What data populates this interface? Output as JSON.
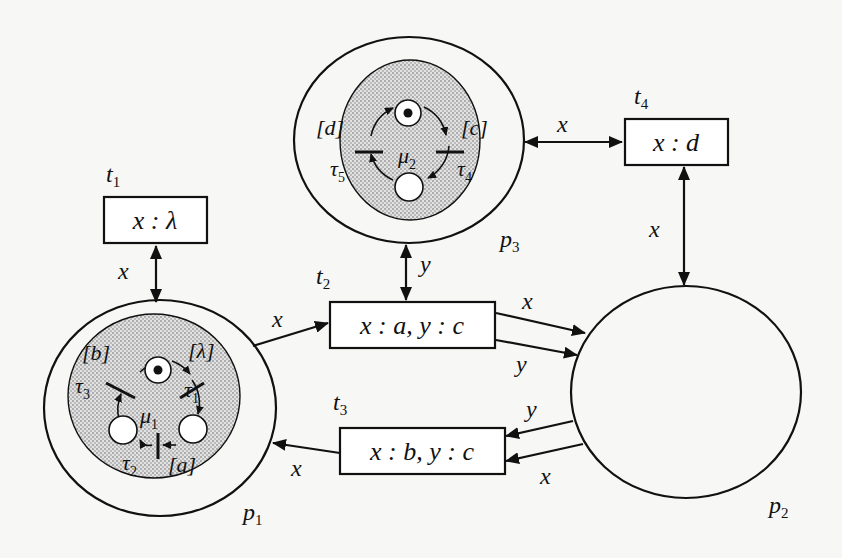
{
  "diagram": {
    "type": "nested-petri-net",
    "places": [
      {
        "id": "p1",
        "label": "p",
        "sub": "1",
        "inner_net": "mu1"
      },
      {
        "id": "p2",
        "label": "p",
        "sub": "2"
      },
      {
        "id": "p3",
        "label": "p",
        "sub": "3",
        "inner_net": "mu2"
      }
    ],
    "transitions": [
      {
        "id": "t1",
        "label": "t",
        "sub": "1",
        "guard": "x : λ"
      },
      {
        "id": "t2",
        "label": "t",
        "sub": "2",
        "guard": "x : a, y : c"
      },
      {
        "id": "t3",
        "label": "t",
        "sub": "3",
        "guard": "x : b, y : c"
      },
      {
        "id": "t4",
        "label": "t",
        "sub": "4",
        "guard": "x : d"
      }
    ],
    "arcs": [
      {
        "from": "p1",
        "to": "t1",
        "label": "x",
        "bidirectional": true
      },
      {
        "from": "p1",
        "to": "t2",
        "label": "x"
      },
      {
        "from": "p3",
        "to": "t2",
        "label": "y",
        "bidirectional": true
      },
      {
        "from": "t2",
        "to": "p2",
        "label": "x"
      },
      {
        "from": "t2",
        "to": "p2",
        "label": "y"
      },
      {
        "from": "p2",
        "to": "t3",
        "label": "y"
      },
      {
        "from": "p2",
        "to": "t3",
        "label": "x"
      },
      {
        "from": "t3",
        "to": "p1",
        "label": "x"
      },
      {
        "from": "p3",
        "to": "t4",
        "label": "x",
        "bidirectional": true
      },
      {
        "from": "t4",
        "to": "p2",
        "label": "x",
        "bidirectional": true
      }
    ],
    "inner_nets": {
      "mu1": {
        "label": "μ",
        "sub": "1",
        "places": 3,
        "marked_place": "top",
        "transitions": [
          {
            "label": "τ",
            "sub": "1",
            "guard": "[λ]"
          },
          {
            "label": "τ",
            "sub": "2",
            "guard": "[a]"
          },
          {
            "label": "τ",
            "sub": "3",
            "guard": "[b]"
          }
        ]
      },
      "mu2": {
        "label": "μ",
        "sub": "2",
        "places": 2,
        "marked_place": "top",
        "transitions": [
          {
            "label": "τ",
            "sub": "4",
            "guard": "[c]"
          },
          {
            "label": "τ",
            "sub": "5",
            "guard": "[d]"
          }
        ]
      }
    }
  }
}
